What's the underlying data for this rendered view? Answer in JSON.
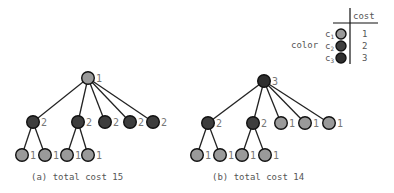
{
  "colors": {
    "c1": "#9a9a9a",
    "c2": "#3d3d3d",
    "c3": "#2e2e2e"
  },
  "legend": {
    "header": "cost",
    "row_label": "color",
    "rows": [
      {
        "name": "c",
        "sub": "1",
        "color_key": "c1",
        "cost": "1"
      },
      {
        "name": "c",
        "sub": "2",
        "color_key": "c2",
        "cost": "2"
      },
      {
        "name": "c",
        "sub": "3",
        "color_key": "c3",
        "cost": "3"
      }
    ]
  },
  "trees": [
    {
      "caption": "(a) total cost 15",
      "root": {
        "x": 88,
        "y": 78,
        "color_key": "c1",
        "cost": "1"
      },
      "children": [
        {
          "x": 33,
          "y": 122,
          "color_key": "c2",
          "cost": "2"
        },
        {
          "x": 78,
          "y": 122,
          "color_key": "c2",
          "cost": "2"
        },
        {
          "x": 105,
          "y": 122,
          "color_key": "c2",
          "cost": "2"
        },
        {
          "x": 130,
          "y": 122,
          "color_key": "c2",
          "cost": "2"
        },
        {
          "x": 153,
          "y": 122,
          "color_key": "c2",
          "cost": "2"
        }
      ],
      "leaves": [
        {
          "parent": 0,
          "x": 22,
          "y": 155,
          "color_key": "c1",
          "cost": "1"
        },
        {
          "parent": 0,
          "x": 45,
          "y": 155,
          "color_key": "c1",
          "cost": "1"
        },
        {
          "parent": 1,
          "x": 67,
          "y": 155,
          "color_key": "c1",
          "cost": "1"
        },
        {
          "parent": 1,
          "x": 88,
          "y": 155,
          "color_key": "c1",
          "cost": "1"
        }
      ]
    },
    {
      "caption": "(b) total cost 14",
      "root": {
        "x": 264,
        "y": 81,
        "color_key": "c3",
        "cost": "3"
      },
      "children": [
        {
          "x": 208,
          "y": 123,
          "color_key": "c2",
          "cost": "2"
        },
        {
          "x": 253,
          "y": 123,
          "color_key": "c2",
          "cost": "2"
        },
        {
          "x": 281,
          "y": 123,
          "color_key": "c1",
          "cost": "1"
        },
        {
          "x": 305,
          "y": 123,
          "color_key": "c1",
          "cost": "1"
        },
        {
          "x": 329,
          "y": 123,
          "color_key": "c1",
          "cost": "1"
        }
      ],
      "leaves": [
        {
          "parent": 0,
          "x": 197,
          "y": 155,
          "color_key": "c1",
          "cost": "1"
        },
        {
          "parent": 0,
          "x": 220,
          "y": 155,
          "color_key": "c1",
          "cost": "1"
        },
        {
          "parent": 1,
          "x": 242,
          "y": 155,
          "color_key": "c1",
          "cost": "1"
        },
        {
          "parent": 1,
          "x": 265,
          "y": 155,
          "color_key": "c1",
          "cost": "1"
        }
      ]
    }
  ]
}
